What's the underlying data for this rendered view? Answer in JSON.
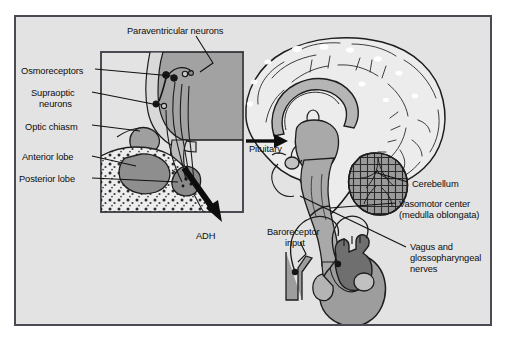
{
  "figure": {
    "background_color": "#e3e3e3",
    "frame_border_color": "#4a4a52",
    "page_background": "#ffffff"
  },
  "palette": {
    "outline": "#1a1a1a",
    "tissue_light": "#e8e8e8",
    "tissue_mid": "#b9b9b9",
    "tissue_dark": "#8f8f8f",
    "tissue_darkest": "#6f6f6f",
    "arrow_black": "#0d0d0d"
  },
  "inset": {
    "name": "hypothalamus-pituitary-detail",
    "x": 101,
    "y": 52,
    "width": 142,
    "height": 160,
    "border_color": "#4a4a52"
  },
  "labels": [
    {
      "id": "paraventricular-neurons",
      "text": "Paraventricular neurons",
      "x": 127,
      "y": 26,
      "align": "left"
    },
    {
      "id": "osmoreceptors",
      "text": "Osmoreceptors",
      "x": 21,
      "y": 66,
      "align": "left"
    },
    {
      "id": "supraoptic-neurons-line1",
      "text": "Supraoptic",
      "x": 31,
      "y": 88,
      "align": "left"
    },
    {
      "id": "supraoptic-neurons-line2",
      "text": "neurons",
      "x": 39,
      "y": 99,
      "align": "left"
    },
    {
      "id": "optic-chiasm",
      "text": "Optic chiasm",
      "x": 25,
      "y": 122,
      "align": "left"
    },
    {
      "id": "anterior-lobe",
      "text": "Anterior lobe",
      "x": 22,
      "y": 152,
      "align": "left"
    },
    {
      "id": "posterior-lobe",
      "text": "Posterior lobe",
      "x": 19,
      "y": 174,
      "align": "left"
    },
    {
      "id": "adh",
      "text": "ADH",
      "x": 196,
      "y": 231,
      "align": "left"
    },
    {
      "id": "pituitary",
      "text": "Pituitary",
      "x": 249,
      "y": 144,
      "align": "left"
    },
    {
      "id": "cerebellum",
      "text": "Cerebellum",
      "x": 412,
      "y": 179,
      "align": "left"
    },
    {
      "id": "vasomotor-center-line1",
      "text": "Vasomotor center",
      "x": 399,
      "y": 199,
      "align": "left"
    },
    {
      "id": "vasomotor-center-line2",
      "text": "(medulla oblongata)",
      "x": 399,
      "y": 210,
      "align": "left"
    },
    {
      "id": "vagus-line1",
      "text": "Vagus and",
      "x": 410,
      "y": 242,
      "align": "left"
    },
    {
      "id": "vagus-line2",
      "text": "glossopharyngeal",
      "x": 410,
      "y": 253,
      "align": "left"
    },
    {
      "id": "vagus-line3",
      "text": "nerves",
      "x": 410,
      "y": 264,
      "align": "left"
    },
    {
      "id": "baroreceptor-input-line1",
      "text": "Baroreceptor",
      "x": 267,
      "y": 227,
      "align": "left"
    },
    {
      "id": "baroreceptor-input-line2",
      "text": "input",
      "x": 285,
      "y": 238,
      "align": "left"
    }
  ],
  "structures": [
    {
      "id": "brain-sagittal",
      "name": "brain-sagittal-section"
    },
    {
      "id": "cerebral-cortex",
      "name": "cerebral-cortex"
    },
    {
      "id": "corpus-callosum",
      "name": "corpus-callosum"
    },
    {
      "id": "brainstem",
      "name": "brainstem"
    },
    {
      "id": "cerebellum-body",
      "name": "cerebellum"
    },
    {
      "id": "pituitary-gland",
      "name": "pituitary-gland"
    },
    {
      "id": "heart",
      "name": "heart"
    },
    {
      "id": "carotid-artery",
      "name": "carotid-artery-baroreceptor"
    },
    {
      "id": "hypothalamus",
      "name": "hypothalamus"
    },
    {
      "id": "optic-chiasm-body",
      "name": "optic-chiasm"
    },
    {
      "id": "anterior-pituitary-lobe",
      "name": "anterior-pituitary-lobe"
    },
    {
      "id": "posterior-pituitary-lobe",
      "name": "posterior-pituitary-lobe"
    },
    {
      "id": "sphenoid-bone",
      "name": "sphenoid-bone-spongy"
    }
  ]
}
